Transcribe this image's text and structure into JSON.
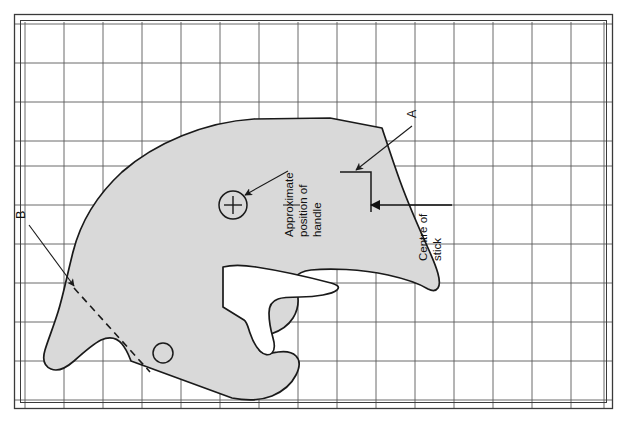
{
  "figure": {
    "kind": "engineering-template-drawing",
    "background_color": "#ffffff",
    "grid": {
      "line_color": "#555555",
      "minor_line_color": "#8a8a8a",
      "frame_color": "#3a3a3a",
      "cell_size_px": 39,
      "columns": 15,
      "rows": 10,
      "origin_x": 25,
      "origin_y": 25
    },
    "shape": {
      "fill_color": "#d9d9d9",
      "stroke_color": "#1a1a1a",
      "stroke_width": 1.6
    }
  },
  "annotations": {
    "label_a": {
      "text": "A",
      "rotation_deg": -90,
      "x": 416,
      "y": 118
    },
    "label_b": {
      "text": "B",
      "rotation_deg": -90,
      "x": 24,
      "y": 218
    },
    "handle_note": {
      "line1": "Approximate",
      "line2": "position of",
      "line3": "handle",
      "rotation_deg": -90
    },
    "centre_note": {
      "line1": "Centre of",
      "line2": "stick",
      "rotation_deg": -90
    }
  },
  "markers": {
    "handle_circle": {
      "name": "approximate-position-of-handle",
      "cx": 233,
      "cy": 205,
      "r": 14,
      "has_crosshair": true
    },
    "small_circle": {
      "name": "lower-hole",
      "cx": 163,
      "cy": 353,
      "r": 10,
      "has_crosshair": false
    }
  },
  "callouts": {
    "arrow_to_handle": {
      "from_x": 288,
      "from_y": 172,
      "to_x": 243,
      "to_y": 196
    },
    "arrow_to_a": {
      "from_x": 411,
      "from_y": 125,
      "to_x": 353,
      "to_y": 172
    },
    "arrow_centre_of_stick": {
      "from_x": 411,
      "from_y": 205,
      "to_x": 370,
      "to_y": 205
    },
    "arrow_to_b": {
      "from_x": 30,
      "from_y": 224,
      "to_x": 72,
      "to_y": 284
    },
    "dashed_line_b": {
      "x1": 72,
      "y1": 284,
      "x2": 148,
      "y2": 368
    }
  }
}
